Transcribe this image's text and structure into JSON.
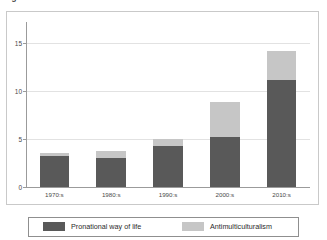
{
  "top_caption": "Figure 1.",
  "chart_data": {
    "type": "bar",
    "subtype": "stacked",
    "title": "",
    "xlabel": "",
    "ylabel": "",
    "categories": [
      "1970:s",
      "1980:s",
      "1990:s",
      "2000:s",
      "2010:s"
    ],
    "series": [
      {
        "name": "Pronational way of life",
        "color": "#595959",
        "values": [
          3.2,
          3.0,
          4.3,
          5.25,
          11.1
        ]
      },
      {
        "name": "Antimulticulturalism",
        "color": "#c6c6c6",
        "values": [
          0.35,
          0.75,
          0.7,
          3.65,
          3.1
        ]
      }
    ],
    "totals": [
      3.55,
      3.75,
      5.0,
      8.9,
      14.2
    ],
    "ylim": [
      0,
      15.6
    ],
    "yticks": [
      0,
      5,
      10,
      15
    ],
    "ytick_labels": [
      "0",
      "5",
      "10",
      "15"
    ],
    "grid": true,
    "legend_position": "bottom"
  },
  "legend": {
    "items": [
      {
        "label": "Pronational way of life",
        "color": "#595959"
      },
      {
        "label": "Antimulticulturalism",
        "color": "#c6c6c6"
      }
    ]
  },
  "colors": {
    "series_dark": "#595959",
    "series_light": "#c6c6c6",
    "grid": "#e2e2e2",
    "axis": "#9b9b9b",
    "frame": "#c9c9c9",
    "text": "#4a4a4a"
  }
}
